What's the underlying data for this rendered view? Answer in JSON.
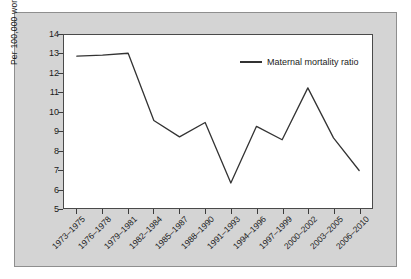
{
  "chart_data": {
    "type": "line",
    "title": "",
    "xlabel": "",
    "ylabel": "Per 100,000 women",
    "ylim": [
      5,
      14
    ],
    "yticks": [
      5,
      6,
      7,
      8,
      9,
      10,
      11,
      12,
      13,
      14
    ],
    "grid": false,
    "legend_position": "top-right",
    "legend_entries": [
      "Maternal mortality ratio"
    ],
    "line_color": "#333333",
    "categories": [
      "1973–1975",
      "1976–1978",
      "1979–1981",
      "1982–1984",
      "1985–1987",
      "1988–1990",
      "1991–1993",
      "1994–1996",
      "1997–1999",
      "2000–2002",
      "2003–2005",
      "2006–2010"
    ],
    "series": [
      {
        "name": "Maternal mortality ratio",
        "values": [
          12.9,
          12.95,
          13.05,
          9.55,
          8.7,
          9.45,
          6.3,
          9.25,
          8.55,
          11.25,
          8.65,
          6.95
        ]
      }
    ]
  },
  "chart": {
    "y_axis_title": "Per 100,000 women",
    "y_tick_labels": [
      "14",
      "13",
      "12",
      "11",
      "10",
      "9",
      "8",
      "7",
      "6",
      "5"
    ],
    "x_tick_labels": [
      "1973–1975",
      "1976–1978",
      "1979–1981",
      "1982–1984",
      "1985–1987",
      "1988–1990",
      "1991–1993",
      "1994–1996",
      "1997–1999",
      "2000–2002",
      "2003–2005",
      "2006–2010"
    ],
    "legend": {
      "label": "Maternal mortality ratio"
    },
    "colors": {
      "line": "#333333",
      "panel_background": "#d4d4d4",
      "plot_background": "#ffffff",
      "axis": "#3c3c3c"
    }
  }
}
